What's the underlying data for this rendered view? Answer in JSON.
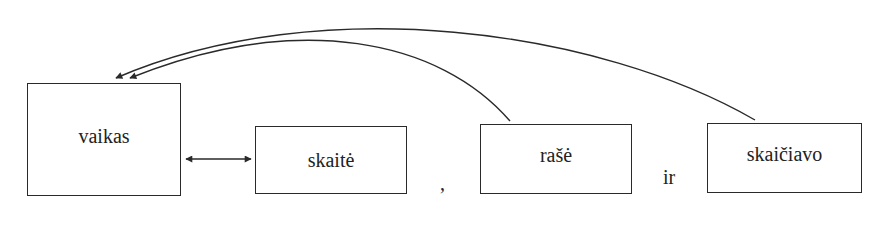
{
  "diagram": {
    "nodes": [
      {
        "id": "vaikas",
        "label": "vaikas"
      },
      {
        "id": "skaite",
        "label": "skaitė"
      },
      {
        "id": "rase",
        "label": "rašė"
      },
      {
        "id": "skaiciavo",
        "label": "skaičiavo"
      }
    ],
    "separators": {
      "comma": ",",
      "conjunction": "ir"
    },
    "edges": [
      {
        "from": "vaikas",
        "to": "skaite",
        "type": "bidirectional"
      },
      {
        "from": "rase",
        "to": "vaikas",
        "type": "directed-curve"
      },
      {
        "from": "skaiciavo",
        "to": "vaikas",
        "type": "directed-curve"
      }
    ],
    "colors": {
      "stroke": "#2a2a2a",
      "text": "#222222",
      "background": "#ffffff"
    }
  }
}
